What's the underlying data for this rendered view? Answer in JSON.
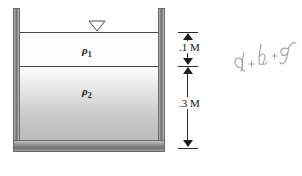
{
  "figure": {
    "type": "fluid-statics-tank-diagram"
  },
  "tank": {
    "surface_marker_icon": "free-surface-triangle-icon",
    "wall_color": "#8d8d8d",
    "outline_color": "#4a4a4a"
  },
  "fluids": {
    "upper": {
      "label": "ρ",
      "subscript": "1",
      "fill_color": "#fdfdfd"
    },
    "lower": {
      "label": "ρ",
      "subscript": "2",
      "fill_color": "#c5c5c5"
    }
  },
  "dimensions": [
    {
      "id": "upper-layer-depth",
      "text": ".1 M",
      "value": 0.1,
      "unit": "M"
    },
    {
      "id": "lower-layer-depth",
      "text": ".3 M",
      "value": 0.3,
      "unit": "M"
    }
  ],
  "annotation": {
    "handwritten_text": "d + h + g",
    "style": "pencil-cursive",
    "color": "#9a9a9a"
  }
}
